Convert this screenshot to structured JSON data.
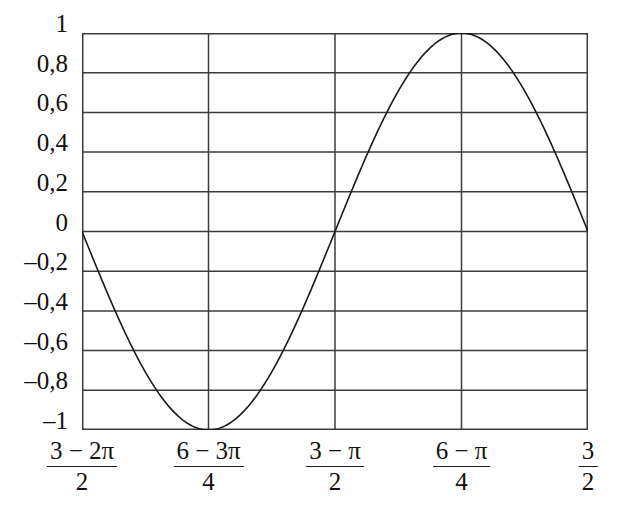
{
  "chart_data": {
    "type": "line",
    "title": "",
    "subtitle": "",
    "xlabel": "",
    "ylabel": "",
    "grid": true,
    "legend": false,
    "legend_position": "none",
    "line_color": "#1a1a1a",
    "grid_color": "#3c3c3c",
    "background_color": "#ffffff",
    "xlim": [
      0,
      4
    ],
    "ylim": [
      -1,
      1
    ],
    "x_tick_positions": [
      0,
      1,
      2,
      3,
      4
    ],
    "x_tick_labels": [
      {
        "numerator": "3 − 2π",
        "denominator": "2"
      },
      {
        "numerator": "6 − 3π",
        "denominator": "4"
      },
      {
        "numerator": "3 − π",
        "denominator": "2"
      },
      {
        "numerator": "6 − π",
        "denominator": "4"
      },
      {
        "numerator": "3",
        "denominator": "2"
      }
    ],
    "y_ticks": [
      1,
      0.8,
      0.6,
      0.4,
      0.2,
      0,
      -0.2,
      -0.4,
      -0.6,
      -0.8,
      -1
    ],
    "y_tick_labels": [
      "1",
      "0,8",
      "0,6",
      "0,4",
      "0,2",
      "0",
      "–0,2",
      "–0,4",
      "–0,6",
      "–0,8",
      "–1"
    ],
    "series": [
      {
        "name": "sine",
        "x": [
          0,
          0.125,
          0.25,
          0.375,
          0.5,
          0.625,
          0.75,
          0.875,
          1,
          1.125,
          1.25,
          1.375,
          1.5,
          1.625,
          1.75,
          1.875,
          2,
          2.125,
          2.25,
          2.375,
          2.5,
          2.625,
          2.75,
          2.875,
          3,
          3.125,
          3.25,
          3.375,
          3.5,
          3.625,
          3.75,
          3.875,
          4
        ],
        "y": [
          0,
          -0.195,
          -0.383,
          -0.556,
          -0.707,
          -0.831,
          -0.924,
          -0.981,
          -1,
          -0.981,
          -0.924,
          -0.831,
          -0.707,
          -0.556,
          -0.383,
          -0.195,
          0,
          0.195,
          0.383,
          0.556,
          0.707,
          0.831,
          0.924,
          0.981,
          1,
          0.981,
          0.924,
          0.831,
          0.707,
          0.556,
          0.383,
          0.195,
          0
        ]
      }
    ],
    "key_points": [
      {
        "label": "start",
        "x": 0,
        "y": 0
      },
      {
        "label": "minimum",
        "x": 1,
        "y": -1
      },
      {
        "label": "zero-crossing",
        "x": 2,
        "y": 0
      },
      {
        "label": "maximum",
        "x": 3,
        "y": 1
      },
      {
        "label": "end",
        "x": 4,
        "y": 0
      }
    ]
  }
}
